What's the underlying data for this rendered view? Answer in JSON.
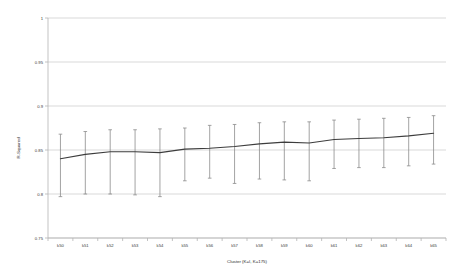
{
  "chart_data": {
    "type": "line",
    "title": "",
    "subtitle": "",
    "xlabel": "Cluster (K=I, K=175)",
    "ylabel": "R-Squared",
    "grid": true,
    "legend": false,
    "categories": [
      "k50",
      "k51",
      "k52",
      "k53",
      "k54",
      "k55",
      "k56",
      "k57",
      "k58",
      "k59",
      "k60",
      "k61",
      "k62",
      "k63",
      "k64",
      "k65"
    ],
    "values": [
      0.84,
      0.845,
      0.848,
      0.848,
      0.847,
      0.851,
      0.852,
      0.854,
      0.857,
      0.859,
      0.858,
      0.862,
      0.863,
      0.864,
      0.866,
      0.869
    ],
    "error_upper": [
      0.868,
      0.871,
      0.873,
      0.873,
      0.874,
      0.875,
      0.878,
      0.879,
      0.881,
      0.882,
      0.882,
      0.884,
      0.885,
      0.886,
      0.887,
      0.889
    ],
    "error_lower": [
      0.797,
      0.8,
      0.8,
      0.799,
      0.797,
      0.815,
      0.818,
      0.812,
      0.817,
      0.816,
      0.815,
      0.829,
      0.83,
      0.83,
      0.832,
      0.834
    ],
    "ylim": [
      0.75,
      1.0
    ],
    "ytick_values": [
      0.75,
      0.8,
      0.85,
      0.9,
      0.95,
      1.0
    ],
    "ytick_labels": [
      "0.75",
      "0.8",
      "0.85",
      "0.9",
      "0.95",
      "1"
    ],
    "series_color": "#3d3d3d",
    "errorbar_color": "#8c8c8c",
    "gridline_color": "#c9c9c9",
    "axis_color": "#b4b4b4",
    "background_color": "#ffffff"
  }
}
